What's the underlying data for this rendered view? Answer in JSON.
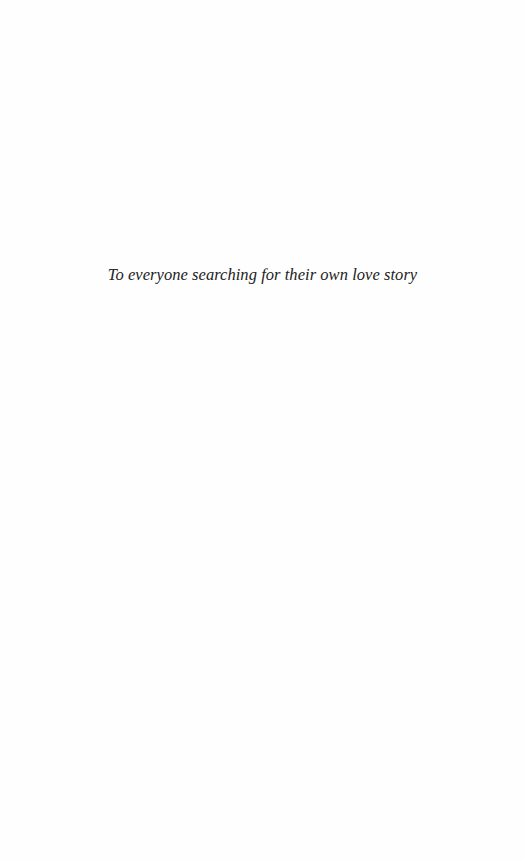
{
  "page": {
    "type": "dedication",
    "dedication_text": "To everyone searching for their own love story"
  }
}
